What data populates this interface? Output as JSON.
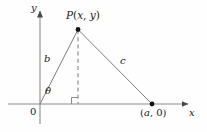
{
  "figure": {
    "kind": "geometry-diagram",
    "background_color": "#fefefe",
    "stroke_color": "#6e6e6e",
    "text_color": "#1a1a1a",
    "axes": {
      "x_axis_label": "x",
      "y_axis_label": "y",
      "origin_label": "0",
      "x_axis_y_px": 104,
      "y_axis_x_px": 40,
      "x_axis_range_px": [
        8,
        192
      ],
      "y_axis_range_px": [
        8,
        124
      ],
      "arrowheads": [
        "x-positive",
        "y-positive"
      ]
    },
    "points": [
      {
        "name": "P",
        "label": "P(x, y)",
        "label_parts": {
          "name": "P",
          "open": "(",
          "x": "x",
          "comma": ", ",
          "y": "y",
          "close": ")"
        },
        "px": [
          78,
          29
        ],
        "marker": "filled-dot"
      },
      {
        "name": "A",
        "label": "(a, 0)",
        "label_parts": {
          "open": "(",
          "a": "a",
          "comma": ", ",
          "zero": "0",
          "close": ")"
        },
        "px": [
          152,
          104
        ],
        "marker": "filled-dot"
      },
      {
        "name": "O",
        "label": "0",
        "px": [
          40,
          104
        ],
        "marker": "none"
      }
    ],
    "segments": [
      {
        "name": "hypotenuse-b",
        "label": "b",
        "from": "O",
        "to": "P",
        "style": "solid"
      },
      {
        "name": "side-c",
        "label": "c",
        "from": "P",
        "to": "A",
        "style": "solid"
      },
      {
        "name": "altitude",
        "label": "",
        "from": "P",
        "to": "foot",
        "style": "dashed"
      }
    ],
    "angles": [
      {
        "name": "theta",
        "label": "θ",
        "at": "O",
        "between": [
          "x-axis",
          "segment-b"
        ]
      },
      {
        "name": "right-angle",
        "label": "",
        "at": "foot",
        "marker": "square"
      }
    ]
  }
}
